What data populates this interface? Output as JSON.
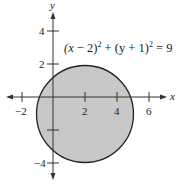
{
  "figure": {
    "equation": "(x − 2)² + (y + 1)² = 9",
    "equation_parts": {
      "p1": "(x",
      "p2": " − 2)",
      "exp1": "2",
      "p3": " + (y + 1)",
      "exp2": "2",
      "p4": " = 9"
    },
    "x_axis_label": "x",
    "y_axis_label": "y",
    "x_ticks": [
      "−2",
      "2",
      "4",
      "6"
    ],
    "y_ticks": [
      "4",
      "2",
      "−4"
    ],
    "circle": {
      "center": [
        2,
        -1
      ],
      "radius": 3
    },
    "fill_color": "#c8c8c8",
    "stroke_color": "#222222"
  }
}
